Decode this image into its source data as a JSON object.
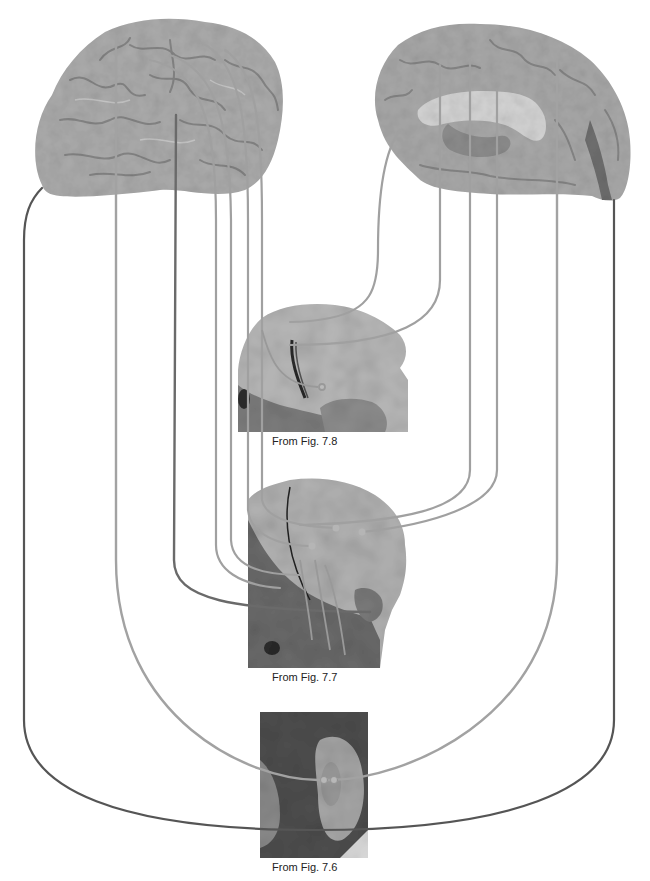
{
  "figure": {
    "brains": [
      {
        "id": "lateral",
        "view": "lateral-surface"
      },
      {
        "id": "medial",
        "view": "medial-surface"
      }
    ],
    "sections": [
      {
        "id": "fig-7-8",
        "caption": "From Fig. 7.8"
      },
      {
        "id": "fig-7-7",
        "caption": "From Fig. 7.7"
      },
      {
        "id": "fig-7-6",
        "caption": "From Fig. 7.6"
      }
    ],
    "colors": {
      "background": "#ffffff",
      "brain": "#a9a9a9",
      "brain_dark": "#7a7a7a",
      "section_light": "#b5b5b5",
      "section_dark": "#4a4a4a",
      "fiber_light": "#a0a0a0",
      "fiber_medium": "#8a8a8a",
      "fiber_dark": "#555555"
    }
  }
}
